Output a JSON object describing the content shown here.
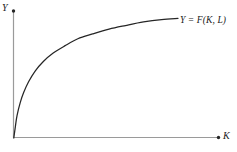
{
  "figure": {
    "background_color": "#ffffff",
    "axis_color": "#9a9a9a",
    "curve_color": "#262626",
    "text_color": "#1a1a1a"
  },
  "axes": {
    "y_label": "Y",
    "x_label": "K",
    "y_arrow_marker": "dot-marker",
    "x_arrow_marker": "dot-marker"
  },
  "annotations": {
    "curve_label": "Y = F(K, L)"
  },
  "chart_data": {
    "type": "line",
    "title": "",
    "subtitle": "",
    "xlabel": "K",
    "ylabel": "Y",
    "grid": false,
    "legend": null,
    "legend_position": "none",
    "xlim": [
      0,
      1
    ],
    "ylim": [
      0,
      1
    ],
    "axis_ticks": {
      "x": [],
      "y": []
    },
    "series": [
      {
        "name": "Y = F(K, L)",
        "description": "Concave production function, increasing at a diminishing rate from the origin",
        "x": [
          0.0,
          0.01,
          0.02,
          0.04,
          0.06,
          0.09,
          0.13,
          0.18,
          0.24,
          0.31,
          0.39,
          0.48,
          0.58,
          0.68,
          0.79,
          0.9,
          1.0
        ],
        "y": [
          0.0,
          0.1,
          0.19,
          0.3,
          0.38,
          0.47,
          0.56,
          0.64,
          0.71,
          0.77,
          0.83,
          0.87,
          0.91,
          0.94,
          0.97,
          0.99,
          1.0
        ]
      }
    ],
    "annotations": [
      {
        "text": "Y = F(K, L)",
        "attached_to": "curve-endpoint",
        "position": "right-of-curve-end"
      }
    ]
  }
}
